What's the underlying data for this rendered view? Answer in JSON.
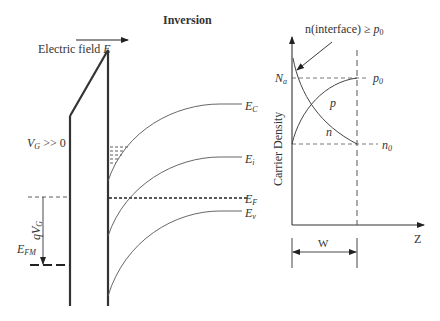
{
  "title": "Inversion",
  "band_diagram": {
    "field_label": "Electric field",
    "field_symbol": "E",
    "gate_voltage_label": "V",
    "gate_voltage_sub": "G",
    "gate_voltage_suffix": " >> 0",
    "qvg_label": "qV",
    "qvg_sub": "G",
    "efm_label": "E",
    "efm_sub": "FM",
    "bands": {
      "ec": {
        "main": "E",
        "sub": "C"
      },
      "ei": {
        "main": "E",
        "sub": "i"
      },
      "ef": {
        "main": "E",
        "sub": "F"
      },
      "ev": {
        "main": "E",
        "sub": "v"
      }
    }
  },
  "carrier_plot": {
    "annotation": "n(interface) ≥ ",
    "annotation_sym": "p",
    "annotation_sub": "0",
    "ylabel": "Carrier Density",
    "xlabel": "Z",
    "na_label": "N",
    "na_sub": "a",
    "p0_label": "p",
    "p0_sub": "0",
    "n0_label": "n",
    "n0_sub": "0",
    "p_curve_label": "p",
    "n_curve_label": "n",
    "width_label": "W"
  }
}
